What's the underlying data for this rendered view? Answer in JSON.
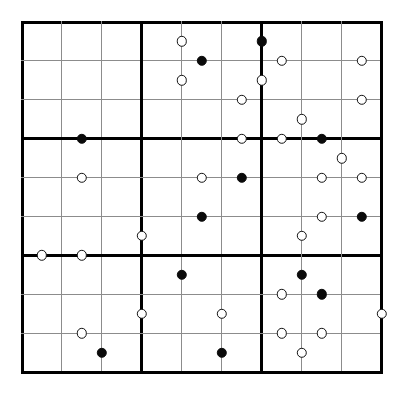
{
  "puzzle": {
    "kind": "kropki-sudoku-grid",
    "title": "",
    "size": 9,
    "box_size": 3,
    "geometry": {
      "origin_x": 22,
      "origin_y": 22,
      "cell_w": 39.95,
      "cell_h": 38.9,
      "thin_line_px": 1,
      "thick_line_px": 3,
      "outer_line_px": 3
    },
    "colors": {
      "background": "#ffffff",
      "thin_line": "#8c8c8c",
      "thick_line": "#000000",
      "black_dot_fill": "#0a0a0a",
      "white_dot_fill": "#ffffff",
      "white_dot_stroke": "#111111"
    },
    "dot_radius_px": 5.2,
    "dots": [
      {
        "col": 4,
        "row": 1,
        "edge": "right",
        "type": "white"
      },
      {
        "col": 5,
        "row": 1,
        "edge": "bottom",
        "type": "black"
      },
      {
        "col": 6,
        "row": 1,
        "edge": "right",
        "type": "black"
      },
      {
        "col": 4,
        "row": 2,
        "edge": "right",
        "type": "white"
      },
      {
        "col": 6,
        "row": 2,
        "edge": "right",
        "type": "white"
      },
      {
        "col": 7,
        "row": 1,
        "edge": "bottom",
        "type": "white"
      },
      {
        "col": 9,
        "row": 1,
        "edge": "bottom",
        "type": "white"
      },
      {
        "col": 6,
        "row": 2,
        "edge": "bottom",
        "type": "white"
      },
      {
        "col": 9,
        "row": 2,
        "edge": "bottom",
        "type": "white"
      },
      {
        "col": 7,
        "row": 3,
        "edge": "right",
        "type": "white"
      },
      {
        "col": 6,
        "row": 3,
        "edge": "bottom",
        "type": "white"
      },
      {
        "col": 7,
        "row": 3,
        "edge": "bottom",
        "type": "white"
      },
      {
        "col": 8,
        "row": 3,
        "edge": "bottom",
        "type": "black"
      },
      {
        "col": 2,
        "row": 3,
        "edge": "bottom",
        "type": "black"
      },
      {
        "col": 8,
        "row": 4,
        "edge": "right",
        "type": "white"
      },
      {
        "col": 2,
        "row": 4,
        "edge": "bottom",
        "type": "white"
      },
      {
        "col": 5,
        "row": 4,
        "edge": "bottom",
        "type": "white"
      },
      {
        "col": 6,
        "row": 4,
        "edge": "bottom",
        "type": "black"
      },
      {
        "col": 8,
        "row": 4,
        "edge": "bottom",
        "type": "white"
      },
      {
        "col": 9,
        "row": 4,
        "edge": "bottom",
        "type": "white"
      },
      {
        "col": 5,
        "row": 5,
        "edge": "bottom",
        "type": "black"
      },
      {
        "col": 8,
        "row": 5,
        "edge": "bottom",
        "type": "white"
      },
      {
        "col": 9,
        "row": 5,
        "edge": "bottom",
        "type": "black"
      },
      {
        "col": 3,
        "row": 6,
        "edge": "right",
        "type": "white"
      },
      {
        "col": 7,
        "row": 6,
        "edge": "right",
        "type": "white"
      },
      {
        "col": 1,
        "row": 6,
        "edge": "bottom",
        "type": "white"
      },
      {
        "col": 2,
        "row": 6,
        "edge": "bottom",
        "type": "white"
      },
      {
        "col": 4,
        "row": 7,
        "edge": "right",
        "type": "black"
      },
      {
        "col": 7,
        "row": 7,
        "edge": "right",
        "type": "black"
      },
      {
        "col": 7,
        "row": 7,
        "edge": "bottom",
        "type": "white"
      },
      {
        "col": 8,
        "row": 7,
        "edge": "bottom",
        "type": "black"
      },
      {
        "col": 3,
        "row": 8,
        "edge": "right",
        "type": "white"
      },
      {
        "col": 5,
        "row": 8,
        "edge": "right",
        "type": "white"
      },
      {
        "col": 9,
        "row": 8,
        "edge": "right",
        "type": "white"
      },
      {
        "col": 2,
        "row": 8,
        "edge": "bottom",
        "type": "white"
      },
      {
        "col": 7,
        "row": 8,
        "edge": "bottom",
        "type": "white"
      },
      {
        "col": 8,
        "row": 8,
        "edge": "bottom",
        "type": "white"
      },
      {
        "col": 2,
        "row": 9,
        "edge": "right",
        "type": "black"
      },
      {
        "col": 5,
        "row": 9,
        "edge": "right",
        "type": "black"
      },
      {
        "col": 7,
        "row": 9,
        "edge": "right",
        "type": "white"
      }
    ]
  }
}
